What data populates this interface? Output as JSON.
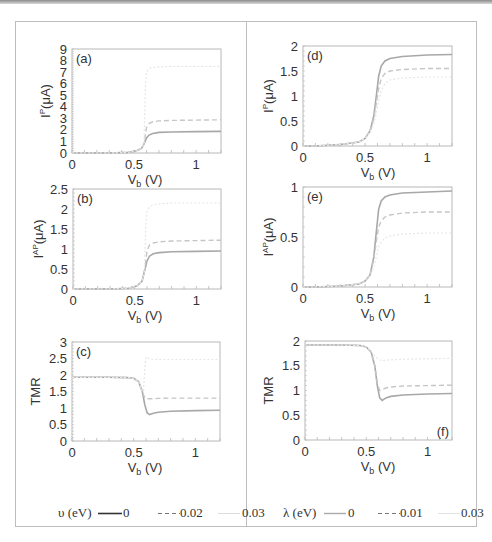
{
  "chart_data": [
    {
      "panel": "a",
      "type": "line",
      "title": "",
      "panel_label": "(a)",
      "xlabel": "V_b (V)",
      "ylabel": "I^P (μA)",
      "xlim": [
        0,
        1.2
      ],
      "ylim": [
        0,
        9
      ],
      "xticks": [
        "0",
        "0.5",
        "1"
      ],
      "yticks": [
        "0",
        "1",
        "2",
        "3",
        "4",
        "5",
        "6",
        "7",
        "8",
        "9"
      ],
      "legend_group": "upsilon",
      "series": [
        {
          "name": "υ=0",
          "style": "solid",
          "x": [
            0,
            0.3,
            0.45,
            0.52,
            0.56,
            0.58,
            0.6,
            0.62,
            0.65,
            0.7,
            0.8,
            1.0,
            1.2
          ],
          "values": [
            0,
            0,
            0.05,
            0.2,
            0.4,
            0.8,
            1.3,
            1.55,
            1.7,
            1.78,
            1.82,
            1.85,
            1.87
          ]
        },
        {
          "name": "υ=0.02",
          "style": "dashed",
          "x": [
            0,
            0.3,
            0.45,
            0.52,
            0.56,
            0.58,
            0.6,
            0.62,
            0.65,
            0.7,
            0.8,
            1.0,
            1.2
          ],
          "values": [
            0,
            0,
            0.05,
            0.2,
            0.4,
            0.8,
            2.2,
            2.55,
            2.7,
            2.78,
            2.82,
            2.85,
            2.87
          ]
        },
        {
          "name": "υ=0.03",
          "style": "dotted",
          "x": [
            0,
            0.3,
            0.45,
            0.52,
            0.56,
            0.58,
            0.59,
            0.6,
            0.62,
            0.65,
            0.7,
            0.8,
            1.0,
            1.2
          ],
          "values": [
            0,
            0,
            0.05,
            0.2,
            0.4,
            0.8,
            5.5,
            7.0,
            7.3,
            7.4,
            7.45,
            7.5,
            7.5,
            7.5
          ]
        }
      ]
    },
    {
      "panel": "b",
      "type": "line",
      "panel_label": "(b)",
      "xlabel": "V_b (V)",
      "ylabel": "I^AP (μA)",
      "xlim": [
        0,
        1.2
      ],
      "ylim": [
        0,
        2.5
      ],
      "xticks": [
        "0",
        "0.5",
        "1"
      ],
      "yticks": [
        "0",
        "0.5",
        "1",
        "1.5",
        "2",
        "2.5"
      ],
      "legend_group": "upsilon",
      "series": [
        {
          "name": "υ=0",
          "style": "solid",
          "x": [
            0,
            0.3,
            0.45,
            0.52,
            0.56,
            0.58,
            0.6,
            0.62,
            0.65,
            0.7,
            0.8,
            1.0,
            1.2
          ],
          "values": [
            0,
            0,
            0.02,
            0.08,
            0.2,
            0.45,
            0.7,
            0.82,
            0.88,
            0.91,
            0.93,
            0.94,
            0.95
          ]
        },
        {
          "name": "υ=0.02",
          "style": "dashed",
          "x": [
            0,
            0.3,
            0.45,
            0.52,
            0.56,
            0.58,
            0.6,
            0.62,
            0.65,
            0.7,
            0.8,
            1.0,
            1.2
          ],
          "values": [
            0,
            0,
            0.02,
            0.08,
            0.2,
            0.45,
            0.95,
            1.1,
            1.15,
            1.18,
            1.2,
            1.21,
            1.22
          ]
        },
        {
          "name": "υ=0.03",
          "style": "dotted",
          "x": [
            0,
            0.3,
            0.45,
            0.52,
            0.56,
            0.58,
            0.59,
            0.6,
            0.62,
            0.65,
            0.7,
            0.8,
            1.0,
            1.2
          ],
          "values": [
            0,
            0,
            0.02,
            0.08,
            0.2,
            0.45,
            1.6,
            1.95,
            2.05,
            2.1,
            2.13,
            2.15,
            2.15,
            2.15
          ]
        }
      ]
    },
    {
      "panel": "c",
      "type": "line",
      "panel_label": "(c)",
      "xlabel": "V_b (V)",
      "ylabel": "TMR",
      "xlim": [
        0,
        1.2
      ],
      "ylim": [
        0,
        3
      ],
      "xticks": [
        "0",
        "0.5",
        "1"
      ],
      "yticks": [
        "0",
        "0.5",
        "1",
        "1.5",
        "2",
        "2.5",
        "3"
      ],
      "legend_group": "upsilon",
      "series": [
        {
          "name": "υ=0",
          "style": "solid",
          "x": [
            0,
            0.3,
            0.45,
            0.5,
            0.54,
            0.57,
            0.59,
            0.61,
            0.63,
            0.66,
            0.7,
            0.8,
            1.0,
            1.2
          ],
          "values": [
            1.93,
            1.93,
            1.92,
            1.9,
            1.8,
            1.5,
            1.1,
            0.85,
            0.8,
            0.84,
            0.87,
            0.9,
            0.92,
            0.93
          ]
        },
        {
          "name": "υ=0.02",
          "style": "dashed",
          "x": [
            0,
            0.3,
            0.45,
            0.5,
            0.54,
            0.57,
            0.59,
            0.6,
            0.62,
            0.65,
            0.7,
            0.8,
            1.0,
            1.2
          ],
          "values": [
            1.93,
            1.93,
            1.92,
            1.9,
            1.8,
            1.5,
            1.3,
            1.3,
            1.28,
            1.28,
            1.29,
            1.3,
            1.3,
            1.3
          ]
        },
        {
          "name": "υ=0.03",
          "style": "dotted",
          "x": [
            0,
            0.3,
            0.45,
            0.5,
            0.54,
            0.57,
            0.58,
            0.59,
            0.6,
            0.62,
            0.65,
            0.7,
            0.8,
            1.0,
            1.2
          ],
          "values": [
            1.93,
            1.93,
            1.92,
            1.9,
            1.8,
            1.5,
            1.5,
            2.2,
            2.55,
            2.5,
            2.48,
            2.47,
            2.47,
            2.47,
            2.47
          ]
        }
      ]
    },
    {
      "panel": "d",
      "type": "line",
      "panel_label": "(d)",
      "xlabel": "V_b (V)",
      "ylabel": "I^P (μA)",
      "xlim": [
        0,
        1.2
      ],
      "ylim": [
        0,
        2
      ],
      "xticks": [
        "0",
        "0.5",
        "1"
      ],
      "yticks": [
        "0",
        "0.5",
        "1",
        "1.5",
        "2"
      ],
      "legend_group": "lambda",
      "series": [
        {
          "name": "λ=0",
          "style": "solid",
          "x": [
            0,
            0.1,
            0.3,
            0.45,
            0.5,
            0.54,
            0.57,
            0.59,
            0.61,
            0.63,
            0.66,
            0.7,
            0.8,
            1.0,
            1.2
          ],
          "values": [
            0,
            0,
            0.03,
            0.08,
            0.15,
            0.3,
            0.6,
            1.0,
            1.4,
            1.6,
            1.7,
            1.75,
            1.79,
            1.82,
            1.83
          ]
        },
        {
          "name": "λ=0.01",
          "style": "dashed",
          "x": [
            0,
            0.1,
            0.3,
            0.45,
            0.5,
            0.54,
            0.57,
            0.59,
            0.61,
            0.63,
            0.66,
            0.7,
            0.8,
            1.0,
            1.2
          ],
          "values": [
            0,
            0,
            0.03,
            0.08,
            0.15,
            0.3,
            0.55,
            0.85,
            1.15,
            1.35,
            1.45,
            1.5,
            1.53,
            1.55,
            1.55
          ]
        },
        {
          "name": "λ=0.03",
          "style": "dotted",
          "x": [
            0,
            0.1,
            0.3,
            0.45,
            0.5,
            0.54,
            0.57,
            0.59,
            0.61,
            0.63,
            0.66,
            0.7,
            0.8,
            1.0,
            1.2
          ],
          "values": [
            0,
            0,
            0.03,
            0.08,
            0.15,
            0.28,
            0.45,
            0.65,
            0.9,
            1.1,
            1.25,
            1.32,
            1.36,
            1.38,
            1.38
          ]
        }
      ]
    },
    {
      "panel": "e",
      "type": "line",
      "panel_label": "(e)",
      "xlabel": "V_b (V)",
      "ylabel": "I^AP (μA)",
      "xlim": [
        0,
        1.2
      ],
      "ylim": [
        0,
        1
      ],
      "xticks": [
        "0",
        "0.5",
        "1"
      ],
      "yticks": [
        "0",
        "0.5",
        "1"
      ],
      "legend_group": "lambda",
      "series": [
        {
          "name": "λ=0",
          "style": "solid",
          "x": [
            0,
            0.1,
            0.3,
            0.45,
            0.5,
            0.54,
            0.57,
            0.59,
            0.61,
            0.63,
            0.66,
            0.7,
            0.8,
            1.0,
            1.2
          ],
          "values": [
            0,
            0,
            0.01,
            0.03,
            0.06,
            0.12,
            0.3,
            0.55,
            0.78,
            0.86,
            0.9,
            0.92,
            0.94,
            0.95,
            0.96
          ]
        },
        {
          "name": "λ=0.01",
          "style": "dashed",
          "x": [
            0,
            0.1,
            0.3,
            0.45,
            0.5,
            0.54,
            0.57,
            0.59,
            0.61,
            0.63,
            0.66,
            0.7,
            0.8,
            1.0,
            1.2
          ],
          "values": [
            0,
            0,
            0.01,
            0.03,
            0.06,
            0.12,
            0.28,
            0.45,
            0.6,
            0.66,
            0.7,
            0.72,
            0.74,
            0.75,
            0.75
          ]
        },
        {
          "name": "λ=0.03",
          "style": "dotted",
          "x": [
            0,
            0.1,
            0.3,
            0.45,
            0.5,
            0.54,
            0.57,
            0.59,
            0.61,
            0.63,
            0.66,
            0.7,
            0.8,
            1.0,
            1.2
          ],
          "values": [
            0,
            0,
            0.01,
            0.03,
            0.06,
            0.11,
            0.2,
            0.3,
            0.4,
            0.45,
            0.49,
            0.51,
            0.53,
            0.54,
            0.54
          ]
        }
      ]
    },
    {
      "panel": "f",
      "type": "line",
      "panel_label": "(f)",
      "xlabel": "V_b (V)",
      "ylabel": "TMR",
      "xlim": [
        0,
        1.2
      ],
      "ylim": [
        0,
        2
      ],
      "xticks": [
        "0",
        "0.5",
        "1"
      ],
      "yticks": [
        "0",
        "0.5",
        "1",
        "1.5",
        "2"
      ],
      "legend_group": "lambda",
      "series": [
        {
          "name": "λ=0",
          "style": "solid",
          "x": [
            0,
            0.3,
            0.45,
            0.5,
            0.54,
            0.57,
            0.59,
            0.61,
            0.63,
            0.66,
            0.7,
            0.8,
            1.0,
            1.2
          ],
          "values": [
            1.92,
            1.92,
            1.91,
            1.88,
            1.78,
            1.5,
            1.1,
            0.85,
            0.8,
            0.85,
            0.88,
            0.91,
            0.93,
            0.94
          ]
        },
        {
          "name": "λ=0.01",
          "style": "dashed",
          "x": [
            0,
            0.3,
            0.45,
            0.5,
            0.54,
            0.57,
            0.59,
            0.61,
            0.63,
            0.66,
            0.7,
            0.8,
            1.0,
            1.2
          ],
          "values": [
            1.92,
            1.92,
            1.91,
            1.88,
            1.78,
            1.5,
            1.15,
            1.0,
            1.02,
            1.05,
            1.07,
            1.09,
            1.1,
            1.11
          ]
        },
        {
          "name": "λ=0.03",
          "style": "dotted",
          "x": [
            0,
            0.3,
            0.45,
            0.5,
            0.54,
            0.57,
            0.59,
            0.61,
            0.63,
            0.66,
            0.7,
            0.8,
            1.0,
            1.2
          ],
          "values": [
            1.92,
            1.92,
            1.91,
            1.88,
            1.8,
            1.7,
            1.65,
            1.62,
            1.6,
            1.61,
            1.62,
            1.63,
            1.64,
            1.65
          ]
        }
      ]
    }
  ],
  "legends": {
    "upsilon": {
      "title": "υ (eV)",
      "entries": [
        {
          "label": "0",
          "style": "solid"
        },
        {
          "label": "0.02",
          "style": "dashed"
        },
        {
          "label": "0.03",
          "style": "dotted"
        }
      ]
    },
    "lambda": {
      "title": "λ (eV)",
      "entries": [
        {
          "label": "0",
          "style": "solid"
        },
        {
          "label": "0.01",
          "style": "dashed"
        },
        {
          "label": "0.03",
          "style": "dotted"
        }
      ]
    }
  },
  "style": {
    "line_color": "#9a9a9a",
    "axis_color": "#b8b8b8",
    "text_color": "#333333"
  }
}
